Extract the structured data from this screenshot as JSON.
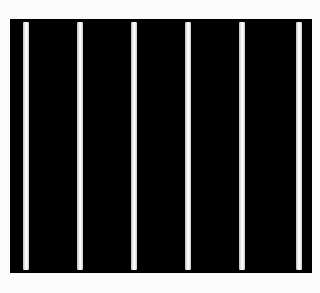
{
  "image": {
    "description": "Black rectangular panel with six evenly spaced vertical white stripes on a white background",
    "background_color": "#fbfbfb",
    "panel_color": "#000000",
    "stripe_color": "#f4f4f4",
    "stripe_count": 6,
    "stripes": [
      {
        "x": 13
      },
      {
        "x": 67
      },
      {
        "x": 121
      },
      {
        "x": 175
      },
      {
        "x": 229
      },
      {
        "x": 286
      }
    ]
  }
}
